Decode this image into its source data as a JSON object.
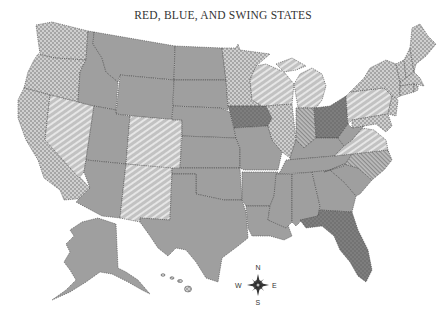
{
  "title": "RED, BLUE, AND SWING STATES",
  "legend_patterns": {
    "red": {
      "fill": "#9d9d9d",
      "pattern": "solid",
      "meaning": "Red states"
    },
    "blue": {
      "fill": "#a8a8a8",
      "pattern": "light-dots",
      "meaning": "Blue states"
    },
    "swing_lean_dem": {
      "fill": "#c4c4c4",
      "pattern": "light-diagonal-stripes",
      "meaning": "Swing states"
    },
    "swing_dense_stripes": {
      "fill": "#b0b0b0",
      "pattern": "dense-diagonal-stripes",
      "meaning": "Swing states"
    },
    "swing_dark": {
      "fill": "#7d7d7d",
      "pattern": "dark-dots",
      "meaning": "Swing states"
    }
  },
  "compass": {
    "n": "N",
    "s": "S",
    "e": "E",
    "w": "W"
  },
  "states": {
    "blue": [
      "WA",
      "OR",
      "CA",
      "MN",
      "IL",
      "NY",
      "VT",
      "NH",
      "ME",
      "MA",
      "CT",
      "RI",
      "NJ",
      "DE",
      "MD",
      "HI"
    ],
    "swing_light_stripes": [
      "NV",
      "CO",
      "NM",
      "WI",
      "MI",
      "PA",
      "VA"
    ],
    "swing_dense_stripes": [
      "IN",
      "NC"
    ],
    "swing_dark_dots": [
      "IA",
      "OH",
      "FL"
    ],
    "red": [
      "ID",
      "MT",
      "WY",
      "UT",
      "AZ",
      "ND",
      "SD",
      "NE",
      "KS",
      "OK",
      "TX",
      "MO",
      "AR",
      "LA",
      "MS",
      "AL",
      "GA",
      "SC",
      "TN",
      "KY",
      "WV",
      "AK"
    ]
  }
}
